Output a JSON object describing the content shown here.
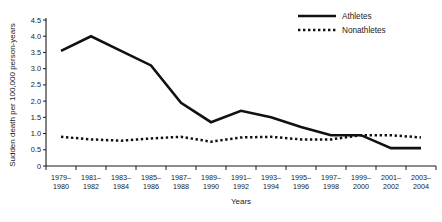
{
  "chart_data": {
    "type": "line",
    "title": "",
    "xlabel": "Years",
    "ylabel": "Sudden death per 100,000 person-years",
    "categories": [
      "1979–1980",
      "1981–1982",
      "1983–1984",
      "1985–1986",
      "1987–1988",
      "1989–1990",
      "1991–1992",
      "1993–1994",
      "1995–1996",
      "1997–1998",
      "1999–2000",
      "2001–2002",
      "2003–2004"
    ],
    "series": [
      {
        "name": "Athletes",
        "style": "solid",
        "values": [
          3.55,
          4.0,
          3.55,
          3.1,
          1.95,
          1.35,
          1.7,
          1.5,
          1.2,
          0.95,
          0.95,
          0.55,
          0.55
        ]
      },
      {
        "name": "Nonathletes",
        "style": "dotted",
        "values": [
          0.9,
          0.82,
          0.78,
          0.85,
          0.9,
          0.75,
          0.88,
          0.9,
          0.82,
          0.82,
          0.95,
          0.95,
          0.88
        ]
      }
    ],
    "yticks": [
      "0",
      "0.5",
      "1.0",
      "1.5",
      "2.0",
      "2.5",
      "3.0",
      "3.5",
      "4.0",
      "4.5"
    ],
    "ylim": [
      0,
      4.5
    ],
    "grid": false,
    "legend_position": "top-right",
    "colors": {
      "series": "#111111",
      "axis": "#1a1a1a",
      "background": "#ffffff"
    }
  },
  "legend": {
    "items": [
      {
        "label": "Athletes"
      },
      {
        "label": "Nonathletes"
      }
    ]
  },
  "axes": {
    "x_title": "Years",
    "y_title": "Sudden death per 100,000 person-years"
  }
}
